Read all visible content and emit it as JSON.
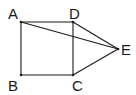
{
  "figure": {
    "points": {
      "A": {
        "label": "A",
        "x": 21,
        "y": 22
      },
      "B": {
        "label": "B",
        "x": 21,
        "y": 75
      },
      "C": {
        "label": "C",
        "x": 73,
        "y": 75
      },
      "D": {
        "label": "D",
        "x": 73,
        "y": 22
      },
      "E": {
        "label": "E",
        "x": 118,
        "y": 49
      }
    },
    "segments": [
      [
        "A",
        "D"
      ],
      [
        "D",
        "C"
      ],
      [
        "C",
        "B"
      ],
      [
        "B",
        "A"
      ],
      [
        "A",
        "E"
      ],
      [
        "D",
        "E"
      ],
      [
        "C",
        "E"
      ]
    ],
    "line_color": "#1a1a1a",
    "background": "#ffffff"
  }
}
